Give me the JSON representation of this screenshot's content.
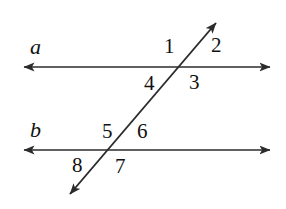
{
  "diagram": {
    "background_color": "#ffffff",
    "stroke_color": "#2b2b2b",
    "text_color": "#111111",
    "line_labels": [
      {
        "name": "line-label-a",
        "text": "a",
        "x": 33,
        "y": 36
      },
      {
        "name": "line-label-b",
        "text": "b",
        "x": 33,
        "y": 119
      }
    ],
    "angle_labels": [
      {
        "name": "angle-label-1",
        "text": "1",
        "x": 170,
        "y": 47
      },
      {
        "name": "angle-label-2",
        "text": "2",
        "x": 216,
        "y": 46
      },
      {
        "name": "angle-label-3",
        "text": "3",
        "x": 194,
        "y": 83
      },
      {
        "name": "angle-label-4",
        "text": "4",
        "x": 150,
        "y": 84
      },
      {
        "name": "angle-label-5",
        "text": "5",
        "x": 108,
        "y": 132
      },
      {
        "name": "angle-label-6",
        "text": "6",
        "x": 142,
        "y": 132
      },
      {
        "name": "angle-label-7",
        "text": "7",
        "x": 121,
        "y": 167
      },
      {
        "name": "angle-label-8",
        "text": "8",
        "x": 78,
        "y": 166
      }
    ],
    "lines": [
      {
        "name": "line-a",
        "label": "a",
        "x1": 22,
        "y1": 67,
        "x2": 272,
        "y2": 67,
        "arrow_start": true,
        "arrow_end": true
      },
      {
        "name": "line-b",
        "label": "b",
        "x1": 22,
        "y1": 150,
        "x2": 272,
        "y2": 150,
        "arrow_start": true,
        "arrow_end": true
      },
      {
        "name": "transversal-line",
        "label": "",
        "x1": 68,
        "y1": 196,
        "x2": 218,
        "y2": 20,
        "arrow_start": true,
        "arrow_end": true
      }
    ],
    "intersections": [
      {
        "name": "intersection-a",
        "x": 185,
        "y": 67
      },
      {
        "name": "intersection-b",
        "x": 114,
        "y": 150
      }
    ]
  }
}
